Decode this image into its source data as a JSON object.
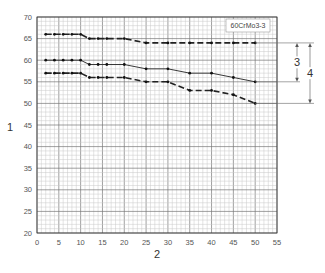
{
  "chart_data": {
    "type": "line",
    "title": "",
    "legend_label": "60CrMo3-3",
    "xlabel": "2",
    "ylabel": "1",
    "xlim": [
      0,
      55
    ],
    "ylim": [
      20,
      70
    ],
    "x_ticks": [
      0,
      5,
      10,
      15,
      20,
      25,
      30,
      35,
      40,
      45,
      50,
      55
    ],
    "y_ticks": [
      20,
      25,
      30,
      35,
      40,
      45,
      50,
      55,
      60,
      65,
      70
    ],
    "grid": true,
    "legend_position": "top-right inside",
    "series": [
      {
        "name": "upper",
        "style": "dashed",
        "x": [
          2,
          4,
          6,
          8,
          10,
          12,
          14,
          16,
          20,
          25,
          30,
          35,
          40,
          45,
          50
        ],
        "values": [
          66,
          66,
          66,
          66,
          66,
          65,
          65,
          65,
          65,
          64,
          64,
          64,
          64,
          64,
          64
        ]
      },
      {
        "name": "middle",
        "style": "solid",
        "x": [
          2,
          4,
          6,
          8,
          10,
          12,
          14,
          16,
          20,
          25,
          30,
          35,
          40,
          45,
          50
        ],
        "values": [
          60,
          60,
          60,
          60,
          60,
          59,
          59,
          59,
          59,
          58,
          58,
          57,
          57,
          56,
          55
        ]
      },
      {
        "name": "lower",
        "style": "dashed",
        "x": [
          2,
          4,
          6,
          8,
          10,
          12,
          14,
          16,
          20,
          25,
          30,
          35,
          40,
          45,
          50
        ],
        "values": [
          57,
          57,
          57,
          57,
          57,
          56,
          56,
          56,
          56,
          55,
          55,
          53,
          53,
          52,
          50
        ]
      }
    ],
    "annotations": [
      {
        "label": "3",
        "description": "range between upper and middle curve at x=50"
      },
      {
        "label": "4",
        "description": "range between upper and lower curve at x=50"
      }
    ]
  }
}
